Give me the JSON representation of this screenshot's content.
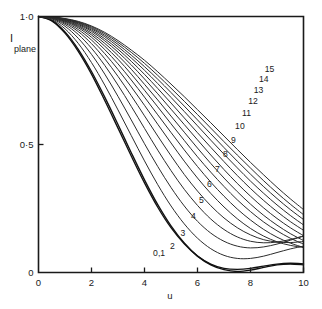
{
  "chart_data": {
    "type": "line",
    "title": "",
    "xlabel": "u",
    "ylabel": "I plane",
    "ylabel_main": "I",
    "ylabel_sub": "plane",
    "xlim": [
      0,
      10
    ],
    "ylim": [
      0,
      1.0
    ],
    "grid": false,
    "legend": "inline-curve-labels",
    "xticks": [
      0,
      2,
      4,
      6,
      8,
      10
    ],
    "xtick_labels": [
      "0",
      "2",
      "4",
      "6",
      "8",
      "10"
    ],
    "yticks": [
      0,
      0.5,
      1.0
    ],
    "ytick_labels": [
      "0",
      "0·5",
      "1·0"
    ],
    "x": [
      0,
      0.5,
      1,
      1.5,
      2,
      2.5,
      3,
      3.5,
      4,
      4.5,
      5,
      5.5,
      6,
      6.5,
      7,
      7.5,
      8,
      8.5,
      9,
      9.5,
      10
    ],
    "series": [
      {
        "name": "0,1",
        "label": "0,1",
        "label_x": 4.55,
        "label_y": 0.075,
        "emphasis": true,
        "values": [
          1.0,
          0.985,
          0.94,
          0.872,
          0.785,
          0.685,
          0.578,
          0.468,
          0.362,
          0.265,
          0.182,
          0.115,
          0.064,
          0.03,
          0.011,
          0.004,
          0.009,
          0.02,
          0.03,
          0.033,
          0.03
        ]
      },
      {
        "name": "1",
        "label": "",
        "label_x": null,
        "label_y": null,
        "emphasis": true,
        "values": [
          1.0,
          0.983,
          0.935,
          0.864,
          0.775,
          0.672,
          0.564,
          0.455,
          0.35,
          0.255,
          0.175,
          0.112,
          0.064,
          0.033,
          0.016,
          0.012,
          0.016,
          0.025,
          0.033,
          0.036,
          0.034
        ]
      },
      {
        "name": "2",
        "label": "2",
        "label_x": 5.05,
        "label_y": 0.105,
        "emphasis": false,
        "values": [
          1.0,
          0.988,
          0.952,
          0.895,
          0.82,
          0.732,
          0.635,
          0.535,
          0.436,
          0.343,
          0.26,
          0.19,
          0.134,
          0.093,
          0.067,
          0.055,
          0.055,
          0.064,
          0.078,
          0.092,
          0.103
        ]
      },
      {
        "name": "3",
        "label": "3",
        "label_x": 5.45,
        "label_y": 0.155,
        "emphasis": false,
        "values": [
          1.0,
          0.991,
          0.962,
          0.915,
          0.852,
          0.775,
          0.688,
          0.596,
          0.503,
          0.414,
          0.332,
          0.26,
          0.2,
          0.154,
          0.122,
          0.103,
          0.096,
          0.1,
          0.111,
          0.126,
          0.142
        ]
      },
      {
        "name": "4",
        "label": "4",
        "label_x": 5.85,
        "label_y": 0.222,
        "emphasis": false,
        "values": [
          1.0,
          0.993,
          0.969,
          0.93,
          0.876,
          0.809,
          0.732,
          0.649,
          0.563,
          0.478,
          0.398,
          0.325,
          0.262,
          0.209,
          0.168,
          0.139,
          0.122,
          0.116,
          0.119,
          0.129,
          0.143
        ]
      },
      {
        "name": "5",
        "label": "5",
        "label_x": 6.15,
        "label_y": 0.283,
        "emphasis": false,
        "values": [
          1.0,
          0.994,
          0.974,
          0.941,
          0.894,
          0.835,
          0.766,
          0.691,
          0.612,
          0.533,
          0.456,
          0.383,
          0.318,
          0.261,
          0.213,
          0.175,
          0.147,
          0.128,
          0.119,
          0.117,
          0.121
        ]
      },
      {
        "name": "6",
        "label": "6",
        "label_x": 6.45,
        "label_y": 0.345,
        "emphasis": false,
        "values": [
          1.0,
          0.995,
          0.978,
          0.949,
          0.908,
          0.855,
          0.793,
          0.725,
          0.653,
          0.579,
          0.506,
          0.435,
          0.369,
          0.309,
          0.256,
          0.21,
          0.172,
          0.142,
          0.12,
          0.106,
          0.098
        ]
      },
      {
        "name": "7",
        "label": "7",
        "label_x": 6.75,
        "label_y": 0.405,
        "emphasis": false,
        "values": [
          1.0,
          0.996,
          0.981,
          0.956,
          0.919,
          0.871,
          0.815,
          0.752,
          0.685,
          0.616,
          0.547,
          0.479,
          0.414,
          0.353,
          0.298,
          0.248,
          0.205,
          0.168,
          0.138,
          0.115,
          0.098
        ]
      },
      {
        "name": "8",
        "label": "8",
        "label_x": 7.05,
        "label_y": 0.462,
        "emphasis": false,
        "values": [
          1.0,
          0.996,
          0.983,
          0.961,
          0.928,
          0.884,
          0.833,
          0.775,
          0.712,
          0.647,
          0.581,
          0.516,
          0.452,
          0.392,
          0.336,
          0.284,
          0.238,
          0.197,
          0.163,
          0.134,
          0.111
        ]
      },
      {
        "name": "9",
        "label": "9",
        "label_x": 7.35,
        "label_y": 0.518,
        "emphasis": false,
        "values": [
          1.0,
          0.997,
          0.985,
          0.965,
          0.935,
          0.895,
          0.848,
          0.794,
          0.735,
          0.674,
          0.611,
          0.548,
          0.486,
          0.426,
          0.369,
          0.316,
          0.267,
          0.223,
          0.185,
          0.152,
          0.125
        ]
      },
      {
        "name": "10",
        "label": "10",
        "label_x": 7.6,
        "label_y": 0.572,
        "emphasis": false,
        "values": [
          1.0,
          0.997,
          0.987,
          0.969,
          0.942,
          0.905,
          0.861,
          0.811,
          0.756,
          0.698,
          0.638,
          0.578,
          0.518,
          0.459,
          0.402,
          0.348,
          0.298,
          0.252,
          0.211,
          0.175,
          0.144
        ]
      },
      {
        "name": "11",
        "label": "11",
        "label_x": 7.85,
        "label_y": 0.625,
        "emphasis": false,
        "values": [
          1.0,
          0.997,
          0.988,
          0.972,
          0.947,
          0.913,
          0.872,
          0.825,
          0.774,
          0.719,
          0.662,
          0.604,
          0.546,
          0.489,
          0.433,
          0.379,
          0.328,
          0.281,
          0.238,
          0.199,
          0.165
        ]
      },
      {
        "name": "12",
        "label": "12",
        "label_x": 8.1,
        "label_y": 0.672,
        "emphasis": false,
        "values": [
          1.0,
          0.998,
          0.989,
          0.975,
          0.952,
          0.921,
          0.882,
          0.838,
          0.79,
          0.738,
          0.684,
          0.629,
          0.573,
          0.517,
          0.462,
          0.409,
          0.357,
          0.309,
          0.264,
          0.223,
          0.186
        ]
      },
      {
        "name": "13",
        "label": "13",
        "label_x": 8.3,
        "label_y": 0.715,
        "emphasis": false,
        "values": [
          1.0,
          0.998,
          0.99,
          0.977,
          0.956,
          0.927,
          0.891,
          0.849,
          0.804,
          0.755,
          0.703,
          0.65,
          0.596,
          0.542,
          0.488,
          0.435,
          0.384,
          0.335,
          0.289,
          0.246,
          0.207
        ]
      },
      {
        "name": "14",
        "label": "14",
        "label_x": 8.5,
        "label_y": 0.757,
        "emphasis": false,
        "values": [
          1.0,
          0.998,
          0.991,
          0.979,
          0.96,
          0.933,
          0.899,
          0.86,
          0.817,
          0.77,
          0.72,
          0.669,
          0.617,
          0.564,
          0.511,
          0.459,
          0.408,
          0.358,
          0.311,
          0.267,
          0.226
        ]
      },
      {
        "name": "15",
        "label": "15",
        "label_x": 8.72,
        "label_y": 0.795,
        "emphasis": false,
        "values": [
          1.0,
          0.998,
          0.992,
          0.981,
          0.963,
          0.938,
          0.906,
          0.869,
          0.829,
          0.784,
          0.736,
          0.687,
          0.636,
          0.585,
          0.533,
          0.481,
          0.43,
          0.381,
          0.333,
          0.288,
          0.246
        ]
      }
    ]
  }
}
